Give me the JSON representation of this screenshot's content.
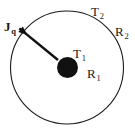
{
  "figure": {
    "background_color": "#ffffff",
    "stroke_color": "#1a1a1a",
    "fill_color": "#111111",
    "outer_circle": {
      "name": "outer-boundary-circle",
      "cx": 67,
      "cy": 67.5,
      "r": 56.5,
      "stroke_width": 1.1
    },
    "inner_disk": {
      "name": "inner-sphere-disk",
      "cx": 67.5,
      "cy": 67.5,
      "r": 10.5
    },
    "heat_flux_arrow": {
      "name": "heat-flux-arrow",
      "x1": 58,
      "y1": 60,
      "x2": 27.5,
      "y2": 35,
      "stroke_width": 2.4,
      "head_length": 9,
      "head_width": 7
    },
    "labels": {
      "heat_flux": {
        "text": "J",
        "sub": "q"
      },
      "outer_temperature": {
        "text": "T",
        "sub": "2"
      },
      "outer_radius": {
        "text": "R",
        "sub": "2"
      },
      "inner_temperature": {
        "text": "T",
        "sub": "1"
      },
      "inner_radius": {
        "text": "R",
        "sub": "1"
      }
    }
  }
}
